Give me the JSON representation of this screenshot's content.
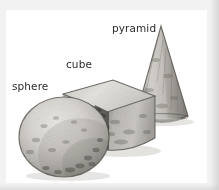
{
  "figure": {
    "kind": "illustration",
    "frame": {
      "mat_color": "#f2f2f2",
      "mat_shadow_color": "#cdcdcd",
      "panel_color": "#ffffff"
    },
    "palette": {
      "label_text": "#2b2b2b",
      "stone_light": "#e3e1de",
      "stone_mid": "#b9b6b1",
      "stone_dark": "#8d8a85",
      "outline": "#5b5954",
      "shadow": "#d8d6d2"
    },
    "objects": [
      {
        "id": "sphere",
        "label": "sphere",
        "shape": "sphere",
        "label_position": "upper-left",
        "z_order": 3,
        "notes": "Large rounded ball, lightest highlight upper-left, speckled granular texture, darker along lower-right edge."
      },
      {
        "id": "cube",
        "label": "cube",
        "shape": "cube",
        "label_position": "above",
        "z_order": 2,
        "notes": "Block seen in three-quarter view: pale top face, dark shaded left/front corner, lighter speckled right face."
      },
      {
        "id": "pyramid",
        "label": "pyramid",
        "shape": "cone",
        "label_position": "upper-left",
        "z_order": 1,
        "notes": "Tall tapering cone/pyramid form with rough stone texture and a dark elliptical base rim."
      }
    ]
  }
}
